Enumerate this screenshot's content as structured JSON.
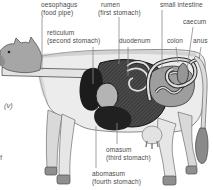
{
  "figure": {
    "type": "labelled-diagram",
    "margin_notes": {
      "left_italic": "(v)",
      "left_fragment": "f"
    },
    "labels": {
      "oesophagus": {
        "name": "oesophagus",
        "detail": "(food pipe)"
      },
      "rumen": {
        "name": "rumen",
        "detail": "(first stomach)"
      },
      "small_intestine": {
        "name": "small intestine",
        "detail": ""
      },
      "caecum": {
        "name": "caecum",
        "detail": ""
      },
      "reticulum": {
        "name": "reticulum",
        "detail": "(second stomach)"
      },
      "duodenum": {
        "name": "duodenum",
        "detail": ""
      },
      "colon": {
        "name": "colon",
        "detail": ""
      },
      "anus": {
        "name": "anus",
        "detail": ""
      },
      "omasum": {
        "name": "omasum",
        "detail": "(third stomach)"
      },
      "abomasum": {
        "name": "abomasum",
        "detail": "(fourth stomach)"
      }
    },
    "colors": {
      "label_text": "#4a4a4a",
      "leader_line": "#8c8c8c",
      "body_fill": "#ececec",
      "body_outline": "#6e6e6e",
      "head_fill": "#a6a6a6",
      "rumen_fill": "#3d3d3d",
      "rumen_hatch": "#7a7a7a",
      "reticulum_fill": "#1c1c1c",
      "omasum_fill": "#b4b4b4",
      "abomasum_fill": "#202020",
      "intestine_fill": "#9e9e9e",
      "caecum_fill": "#969696",
      "tube_light": "#dedede",
      "tube_dark": "#2b2b2b",
      "hoof_fill": "#8f8f8f",
      "tail_tuft": "#8a8a8a",
      "oesophagus_tube": "#e3e3e3"
    }
  }
}
